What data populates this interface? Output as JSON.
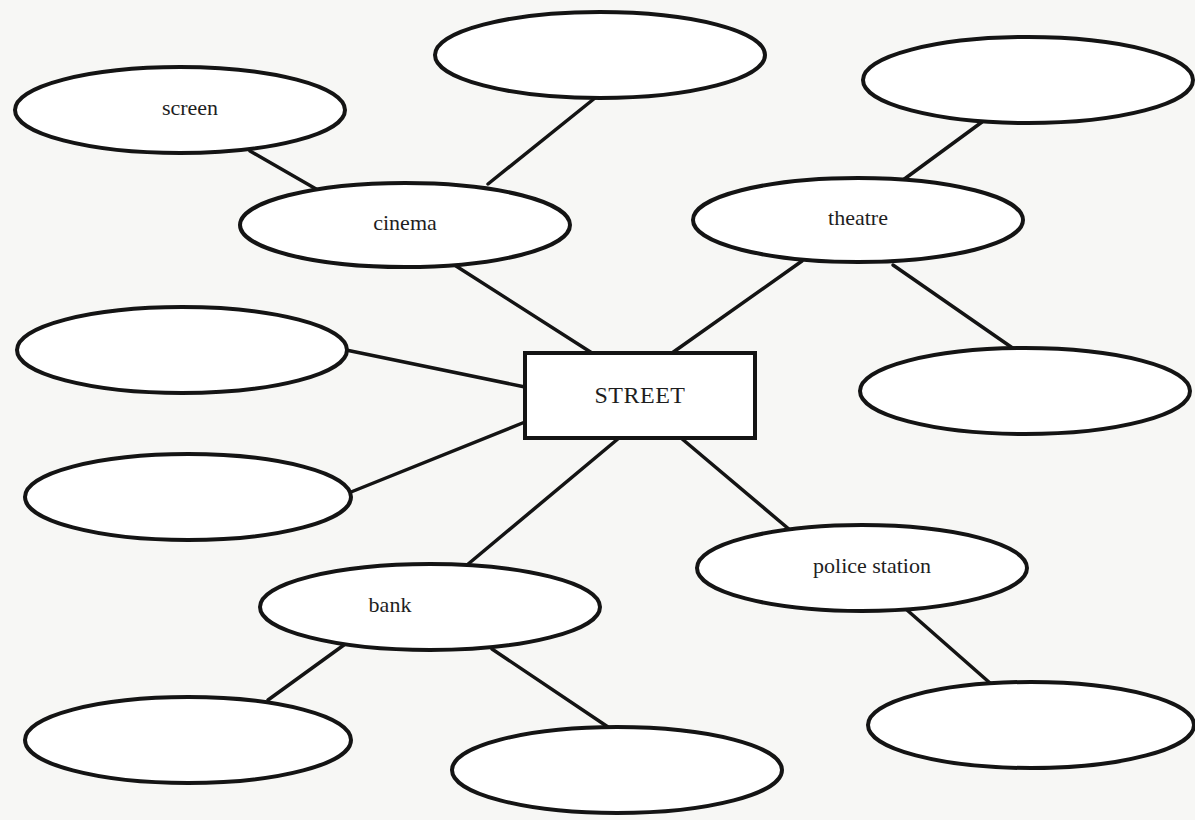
{
  "diagram": {
    "type": "mind-map",
    "center": {
      "label": "STREET",
      "x": 525,
      "y": 353,
      "w": 230,
      "h": 85
    },
    "nodes": [
      {
        "id": "screen",
        "label": "screen",
        "cx": 180,
        "cy": 110,
        "rx": 165,
        "ry": 43,
        "label_dx": 10
      },
      {
        "id": "blank-top",
        "label": "",
        "cx": 600,
        "cy": 55,
        "rx": 165,
        "ry": 43
      },
      {
        "id": "blank-top-right",
        "label": "",
        "cx": 1028,
        "cy": 80,
        "rx": 165,
        "ry": 43
      },
      {
        "id": "cinema",
        "label": "cinema",
        "cx": 405,
        "cy": 225,
        "rx": 165,
        "ry": 42
      },
      {
        "id": "theatre",
        "label": "theatre",
        "cx": 858,
        "cy": 220,
        "rx": 165,
        "ry": 42
      },
      {
        "id": "blank-left-1",
        "label": "",
        "cx": 182,
        "cy": 350,
        "rx": 165,
        "ry": 43
      },
      {
        "id": "blank-left-2",
        "label": "",
        "cx": 188,
        "cy": 497,
        "rx": 163,
        "ry": 43
      },
      {
        "id": "blank-right",
        "label": "",
        "cx": 1025,
        "cy": 391,
        "rx": 165,
        "ry": 43
      },
      {
        "id": "police-station",
        "label": "police station",
        "cx": 862,
        "cy": 568,
        "rx": 165,
        "ry": 43,
        "label_dx": 10
      },
      {
        "id": "bank",
        "label": "bank",
        "cx": 430,
        "cy": 607,
        "rx": 170,
        "ry": 43,
        "label_dx": -40
      },
      {
        "id": "blank-bottom-left",
        "label": "",
        "cx": 188,
        "cy": 740,
        "rx": 163,
        "ry": 43
      },
      {
        "id": "blank-bottom-center",
        "label": "",
        "cx": 617,
        "cy": 770,
        "rx": 165,
        "ry": 43
      },
      {
        "id": "blank-bottom-right",
        "label": "",
        "cx": 1031,
        "cy": 725,
        "rx": 163,
        "ry": 43
      }
    ],
    "edges": [
      {
        "from": "screen",
        "to": "cinema",
        "x1": 250,
        "y1": 151,
        "x2": 330,
        "y2": 197
      },
      {
        "from": "blank-top",
        "to": "cinema",
        "x1": 595,
        "y1": 98,
        "x2": 488,
        "y2": 184
      },
      {
        "from": "cinema",
        "to": "STREET",
        "x1": 456,
        "y1": 266,
        "x2": 592,
        "y2": 353
      },
      {
        "from": "blank-top-right",
        "to": "theatre",
        "x1": 982,
        "y1": 122,
        "x2": 903,
        "y2": 180
      },
      {
        "from": "theatre",
        "to": "STREET",
        "x1": 802,
        "y1": 261,
        "x2": 672,
        "y2": 353
      },
      {
        "from": "theatre",
        "to": "blank-right",
        "x1": 893,
        "y1": 265,
        "x2": 1014,
        "y2": 349
      },
      {
        "from": "blank-left-1",
        "to": "STREET",
        "x1": 346,
        "y1": 350,
        "x2": 525,
        "y2": 387
      },
      {
        "from": "blank-left-2",
        "to": "STREET",
        "x1": 351,
        "y1": 492,
        "x2": 525,
        "y2": 422
      },
      {
        "from": "STREET",
        "to": "bank",
        "x1": 619,
        "y1": 438,
        "x2": 467,
        "y2": 565
      },
      {
        "from": "STREET",
        "to": "police-station",
        "x1": 681,
        "y1": 438,
        "x2": 790,
        "y2": 530
      },
      {
        "from": "bank",
        "to": "blank-bottom-left",
        "x1": 348,
        "y1": 642,
        "x2": 268,
        "y2": 700
      },
      {
        "from": "bank",
        "to": "blank-bottom-center",
        "x1": 492,
        "y1": 649,
        "x2": 608,
        "y2": 727
      },
      {
        "from": "police-station",
        "to": "blank-bottom-right",
        "x1": 907,
        "y1": 610,
        "x2": 990,
        "y2": 683
      }
    ],
    "style": {
      "stroke": "#141414",
      "stroke_width": 4,
      "fill": "#ffffff",
      "background": "#f7f7f5"
    }
  }
}
